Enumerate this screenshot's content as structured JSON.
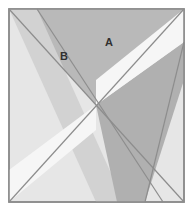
{
  "figure": {
    "type": "geometry-diagram",
    "canvas": {
      "width": 193,
      "height": 211,
      "background": "#ffffff"
    },
    "square": {
      "name": "outer-square",
      "x": 9,
      "y": 9,
      "width": 175,
      "height": 193,
      "fill": "#e6e6e6",
      "stroke": "#8d8d8d",
      "stroke_width": 1.6
    },
    "colors": {
      "background_light": "#e6e6e6",
      "region_a_gray": "#b9b9b9",
      "band_white": "#f6f6f6",
      "band_dark": "#b0b0b0",
      "band_mid": "#d2d2d2",
      "outline": "#8d8d8d",
      "label_text": "#303030",
      "page_background": "#ffffff"
    },
    "polygons": [
      {
        "name": "region-a-upper-triangle",
        "points": "9,9 184,9 96,105",
        "fill": "#b9b9b9"
      },
      {
        "name": "band-b-strip",
        "points": "9,9 37,9 124,202 96,202",
        "fill": "#d2d2d2"
      },
      {
        "name": "band-dark-lower",
        "points": "96,105 184,42 184,80 145,202 117,202",
        "fill": "#b0b0b0"
      },
      {
        "name": "band-white-upper-right",
        "points": "184,9 184,42 96,105 96,80",
        "fill": "#f6f6f6"
      },
      {
        "name": "band-white-lower-left",
        "points": "96,105 96,130 9,202 9,170",
        "fill": "#f6f6f6"
      }
    ],
    "lines": [
      {
        "name": "diagonal-tl-br",
        "x1": 9,
        "y1": 9,
        "x2": 184,
        "y2": 202
      },
      {
        "name": "diagonal-tr-bl",
        "x1": 184,
        "y1": 9,
        "x2": 9,
        "y2": 202
      },
      {
        "name": "band-b-edge",
        "x1": 37,
        "y1": 9,
        "x2": 163,
        "y2": 202
      },
      {
        "name": "band-dark-edge",
        "x1": 184,
        "y1": 42,
        "x2": 145,
        "y2": 202
      }
    ],
    "labels": [
      {
        "name": "region-label-a",
        "text": "A",
        "x": 109,
        "y": 43
      },
      {
        "name": "region-label-b",
        "text": "B",
        "x": 64,
        "y": 57
      }
    ]
  }
}
